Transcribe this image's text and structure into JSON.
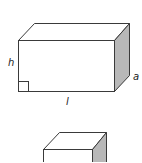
{
  "figure": {
    "type": "rectangular prism diagrams",
    "colors": {
      "line": "#3a3a3a",
      "side_shade": "#b8b8b8",
      "background": "#ffffff"
    },
    "box1": {
      "labels": {
        "height": "h",
        "length": "l",
        "depth": "a"
      },
      "right_angle_marker": true
    },
    "box2": {
      "labels": {}
    }
  }
}
